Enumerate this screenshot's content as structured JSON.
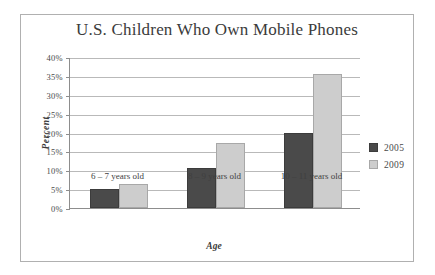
{
  "chart_data": {
    "type": "bar",
    "title": "U.S. Children Who Own Mobile Phones",
    "xlabel": "Age",
    "ylabel": "Percent",
    "categories": [
      "6 – 7 years old",
      "8 – 9 years old",
      "10 – 11 years old"
    ],
    "series": [
      {
        "name": "2005",
        "color": "#4a4a4a",
        "values": [
          5,
          10.5,
          19.8
        ]
      },
      {
        "name": "2009",
        "color": "#cdcdcd",
        "values": [
          6.3,
          17.2,
          35.5
        ]
      }
    ],
    "ylim": [
      0,
      40
    ],
    "ytick_values": [
      0,
      5,
      10,
      15,
      20,
      25,
      30,
      35,
      40
    ],
    "ytick_labels": [
      "0%",
      "5%",
      "10%",
      "15%",
      "20%",
      "25%",
      "30%",
      "35%",
      "40%"
    ],
    "grid": "horizontal",
    "legend_position": "right",
    "legend_entries": [
      "2005",
      "2009"
    ],
    "frame_border_color": "#b0b0b0",
    "gridline_color": "#b9b9b9",
    "axis_color": "#8d8d8d",
    "background_color": "#ffffff"
  }
}
